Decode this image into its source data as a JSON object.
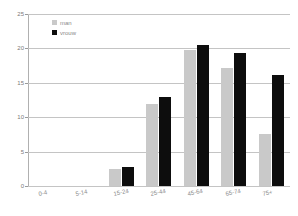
{
  "chart_data": {
    "type": "bar",
    "title": "",
    "subtitle": "",
    "xlabel": "",
    "ylabel": "",
    "categories": [
      "0-4",
      "5-14",
      "15-24",
      "25-44",
      "45-64",
      "65-74",
      "75+"
    ],
    "series": [
      {
        "name": "man",
        "color": "#c9c9c9",
        "values": [
          0,
          0,
          2.5,
          11.9,
          19.7,
          17.2,
          7.6
        ]
      },
      {
        "name": "vrouw",
        "color": "#0d0d0d",
        "values": [
          0,
          0,
          2.8,
          13.0,
          20.5,
          19.4,
          16.2
        ]
      }
    ],
    "ylim": [
      0,
      25
    ],
    "yticks": [
      0,
      5,
      10,
      15,
      20,
      25
    ],
    "ytick_labels": [
      "0",
      "5",
      "10",
      "15",
      "20",
      "25"
    ],
    "grid": "horizontal",
    "legend_position": "top-left",
    "legend": [
      {
        "label": "man",
        "swatch": "#c9c9c9"
      },
      {
        "label": "vrouw",
        "swatch": "#0d0d0d"
      }
    ],
    "background_color": "#ffffff",
    "gridline_color": "#c4c4c4",
    "axis_color": "#b0b0b0",
    "tick_label_color": "#8a8a8a"
  }
}
